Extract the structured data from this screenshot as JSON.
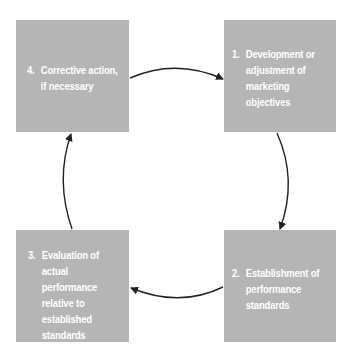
{
  "diagram": {
    "type": "cycle",
    "colors": {
      "box_fill": "#b5b5b5",
      "box_text": "#ffffff",
      "arrow": "#222222",
      "background": "#ffffff"
    },
    "steps": [
      {
        "id": "step-1",
        "number": "1.",
        "lines": [
          "Development or",
          "adjustment of",
          "marketing",
          "objectives"
        ]
      },
      {
        "id": "step-2",
        "number": "2.",
        "lines": [
          "Establishment of",
          "performance",
          "standards"
        ]
      },
      {
        "id": "step-3",
        "number": "3.",
        "lines": [
          "Evaluation of",
          "actual",
          "performance",
          "relative to",
          "established",
          "standards"
        ]
      },
      {
        "id": "step-4",
        "number": "4.",
        "lines": [
          "Corrective action,",
          "if necessary"
        ]
      }
    ],
    "flow": [
      {
        "from": "step-4",
        "to": "step-1"
      },
      {
        "from": "step-1",
        "to": "step-2"
      },
      {
        "from": "step-2",
        "to": "step-3"
      },
      {
        "from": "step-3",
        "to": "step-4"
      }
    ]
  }
}
